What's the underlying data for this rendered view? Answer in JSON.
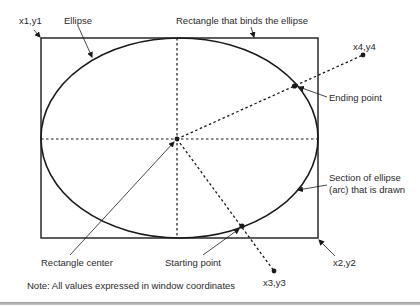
{
  "labels": {
    "corner1": "x1,y1",
    "ellipse": "Ellipse",
    "rectangle": "Rectangle that binds the ellipse",
    "point4": "x4,y4",
    "ending_point": "Ending point",
    "arc_section_line1": "Section of ellipse",
    "arc_section_line2": "(arc) that is drawn",
    "corner2": "x2,y2",
    "rectangle_center": "Rectangle center",
    "starting_point": "Starting point",
    "point3": "x3,y3",
    "note": "Note: All values expressed in window coordinates"
  },
  "colors": {
    "stroke": "#1a1a1a",
    "background": "#ffffff",
    "rule": "#a8a8a8"
  }
}
